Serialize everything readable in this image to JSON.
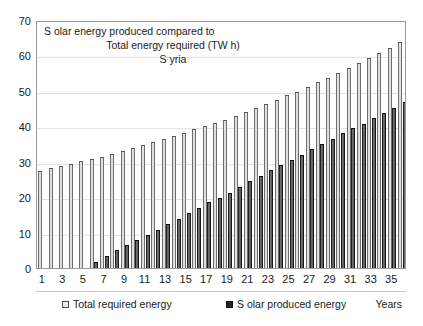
{
  "chart_data": {
    "type": "bar",
    "title_lines": [
      "S olar energy produced compared to",
      "Total energy required (TW h)",
      "S yria"
    ],
    "xlabel": "Years",
    "ylabel": "",
    "ylim": [
      0,
      70
    ],
    "ytick_step": 10,
    "yticks": [
      0,
      10,
      20,
      30,
      40,
      50,
      60,
      70
    ],
    "grid": true,
    "legend_position": "bottom",
    "categories": [
      1,
      2,
      3,
      4,
      5,
      6,
      7,
      8,
      9,
      10,
      11,
      12,
      13,
      14,
      15,
      16,
      17,
      18,
      19,
      20,
      21,
      22,
      23,
      24,
      25,
      26,
      27,
      28,
      29,
      30,
      31,
      32,
      33,
      34,
      35,
      36
    ],
    "xtick_labels": [
      1,
      3,
      5,
      7,
      9,
      11,
      13,
      15,
      17,
      19,
      21,
      23,
      25,
      27,
      29,
      31,
      33,
      35
    ],
    "series": [
      {
        "name": "Total required energy",
        "color": "#e8e8e8",
        "values": [
          27.3,
          28.2,
          28.9,
          29.4,
          30.2,
          30.7,
          31.4,
          32.3,
          33.1,
          33.9,
          34.6,
          35.5,
          36.4,
          37.4,
          38.2,
          39.2,
          40.0,
          41.0,
          41.8,
          42.9,
          44.1,
          45.2,
          46.2,
          47.5,
          48.7,
          49.8,
          51.2,
          52.4,
          53.7,
          55.1,
          56.4,
          57.9,
          59.4,
          60.7,
          62.2,
          63.7
        ]
      },
      {
        "name": "Solar produced energy",
        "color": "#232323",
        "values": [
          0,
          0,
          0,
          0,
          0,
          1.8,
          3.4,
          5.0,
          6.4,
          8.0,
          9.4,
          10.8,
          12.3,
          13.8,
          15.4,
          16.9,
          18.5,
          19.9,
          21.3,
          23.0,
          24.5,
          26.0,
          27.7,
          29.2,
          30.5,
          31.9,
          33.5,
          34.9,
          36.4,
          38.0,
          39.4,
          40.7,
          42.3,
          43.7,
          45.2,
          46.8
        ]
      }
    ]
  },
  "legend": {
    "required_label": "Total required energy",
    "solar_label": "S olar produced energy",
    "years_label": "Years"
  }
}
